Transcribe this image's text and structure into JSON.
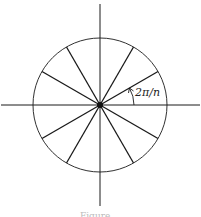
{
  "figure": {
    "angle_label": "2π/n",
    "caption": "Figure",
    "spoke_count": 12,
    "colors": {
      "stroke": "#1a1a1a",
      "background": "#ffffff"
    }
  }
}
